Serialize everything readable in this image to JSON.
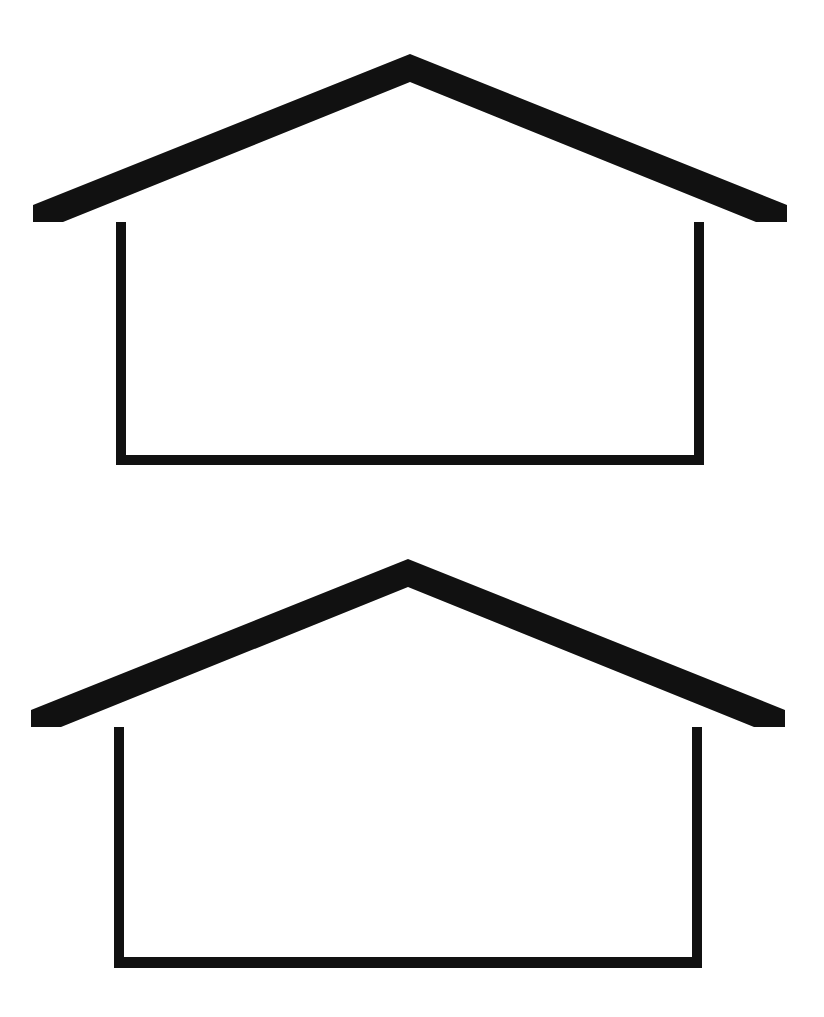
{
  "document": {
    "title": "House Outline Figures",
    "background_color": "#ffffff",
    "ink_color": "#111111",
    "canvas": {
      "width": 824,
      "height": 1017
    },
    "description": "Two identical line-drawing pictograms of a simple house: a wide low-pitch gable roof with overhanging eaves above an open rectangular body.",
    "figure_count": 2
  },
  "figures": [
    {
      "name": "house-figure-top",
      "label": "",
      "ink_color": "#111111",
      "panel": {
        "x": 0,
        "y": 0,
        "width": 824,
        "height": 508
      },
      "geometry": {
        "apex": {
          "x": 410,
          "y": 62
        },
        "eave_band": {
          "left_tip_x": 38,
          "right_tip_x": 781,
          "top_y": 205,
          "bottom_y": 222
        },
        "body": {
          "left_x": 116,
          "right_x": 704,
          "top_y": 222,
          "bottom_y": 465
        },
        "stroke_widths": {
          "roof_slope": 13,
          "eave_band": 16,
          "wall": 10,
          "floor": 11
        }
      },
      "paths": {
        "roof": "M 410 54 L 787 205 L 787 222 L 756 222 L 410 82 L 63 222 L 33 222 L 33 205 Z",
        "body": "M 116 222 L 126 222 L 126 455 L 694 455 L 694 222 L 704 222 L 704 465 L 116 465 Z"
      }
    },
    {
      "name": "house-figure-bottom",
      "label": "",
      "ink_color": "#111111",
      "panel": {
        "x": 0,
        "y": 508,
        "width": 824,
        "height": 509
      },
      "geometry": {
        "apex": {
          "x": 408,
          "y": 567
        },
        "eave_band": {
          "left_tip_x": 38,
          "right_tip_x": 779,
          "top_y": 710,
          "bottom_y": 727
        },
        "body": {
          "left_x": 114,
          "right_x": 702,
          "top_y": 727,
          "bottom_y": 968
        },
        "stroke_widths": {
          "roof_slope": 13,
          "eave_band": 16,
          "wall": 10,
          "floor": 12
        }
      },
      "paths": {
        "roof": "M 408 559 L 785 710 L 785 727 L 754 727 L 408 587 L 61 727 L 31 727 L 31 710 Z",
        "body": "M 114 727 L 124 727 L 124 957 L 692 957 L 692 727 L 702 727 L 702 968 L 114 968 Z"
      }
    }
  ]
}
